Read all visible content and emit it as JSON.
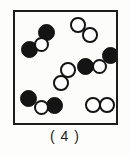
{
  "figure": {
    "caption": "( 4 )",
    "box": {
      "x": 13,
      "y": 10,
      "width": 105,
      "height": 115,
      "border_color": "#1c1c1c",
      "background": "#fcfcfa"
    },
    "legend": {
      "filled_atom_color": "#141414",
      "open_atom_fill": "#ffffff",
      "open_atom_stroke": "#141414"
    },
    "counts": {
      "triatomic_molecules": 3,
      "diatomic_molecules": 3,
      "total_molecules": 6,
      "filled_atoms": 6,
      "open_atoms": 9
    },
    "molecules": [
      {
        "name": "triatomic-top-left",
        "type": "filled-open-filled",
        "atoms": [
          {
            "kind": "filled",
            "cx": 31,
            "cy": 20,
            "r": 8.5
          },
          {
            "kind": "open",
            "cx": 26,
            "cy": 32,
            "r": 7.5
          },
          {
            "kind": "filled",
            "cx": 14,
            "cy": 37,
            "r": 8.5
          }
        ]
      },
      {
        "name": "diatomic-top-right",
        "type": "open-open",
        "atoms": [
          {
            "kind": "open",
            "cx": 63,
            "cy": 13,
            "r": 7.8
          },
          {
            "kind": "open",
            "cx": 75,
            "cy": 23,
            "r": 7.8
          }
        ]
      },
      {
        "name": "triatomic-right-middle",
        "type": "filled-open-filled",
        "atoms": [
          {
            "kind": "filled",
            "cx": 95,
            "cy": 43,
            "r": 8.5
          },
          {
            "kind": "open",
            "cx": 84,
            "cy": 54,
            "r": 7.5
          },
          {
            "kind": "filled",
            "cx": 70,
            "cy": 54,
            "r": 8.5
          }
        ]
      },
      {
        "name": "diatomic-center",
        "type": "open-open",
        "atoms": [
          {
            "kind": "open",
            "cx": 53,
            "cy": 58,
            "r": 7.8
          },
          {
            "kind": "open",
            "cx": 46,
            "cy": 71,
            "r": 7.8
          }
        ]
      },
      {
        "name": "triatomic-bottom-left",
        "type": "filled-open-filled",
        "atoms": [
          {
            "kind": "filled",
            "cx": 13,
            "cy": 86,
            "r": 8.5
          },
          {
            "kind": "open",
            "cx": 26,
            "cy": 95,
            "r": 7.5
          },
          {
            "kind": "filled",
            "cx": 39,
            "cy": 93,
            "r": 8.5
          }
        ]
      },
      {
        "name": "diatomic-bottom-right",
        "type": "open-open",
        "atoms": [
          {
            "kind": "open",
            "cx": 78,
            "cy": 93,
            "r": 7.8
          },
          {
            "kind": "open",
            "cx": 92,
            "cy": 93,
            "r": 7.8
          }
        ]
      }
    ]
  }
}
